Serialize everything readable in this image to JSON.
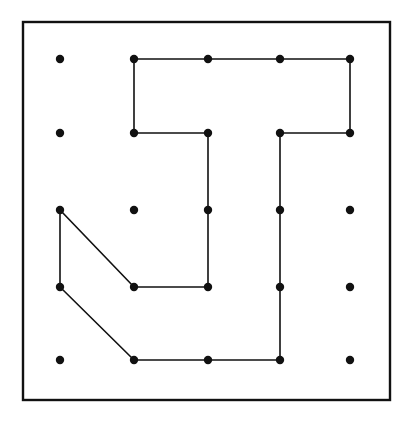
{
  "diagram": {
    "type": "geoboard",
    "title": "",
    "colors": {
      "background": "#ffffff",
      "ink": "#111111"
    },
    "frame": {
      "x": 23,
      "y": 22,
      "width": 367,
      "height": 378,
      "stroke_width": 2.4
    },
    "grid": {
      "columns": 5,
      "rows": 5,
      "x": [
        60,
        134,
        208,
        280,
        350
      ],
      "y": [
        59,
        133,
        210,
        287,
        360
      ],
      "dot_radius": 4.2
    },
    "polygon": {
      "description": "Closed rubber-band shape around pegs (col,row zero-indexed from top-left)",
      "vertices": [
        {
          "col": 1,
          "row": 0
        },
        {
          "col": 4,
          "row": 0
        },
        {
          "col": 4,
          "row": 1
        },
        {
          "col": 3,
          "row": 1
        },
        {
          "col": 3,
          "row": 4
        },
        {
          "col": 1,
          "row": 4
        },
        {
          "col": 0,
          "row": 3
        },
        {
          "col": 0,
          "row": 2
        },
        {
          "col": 1,
          "row": 3
        },
        {
          "col": 2,
          "row": 3
        },
        {
          "col": 2,
          "row": 1
        },
        {
          "col": 1,
          "row": 1
        }
      ],
      "stroke_width": 1.6
    }
  }
}
